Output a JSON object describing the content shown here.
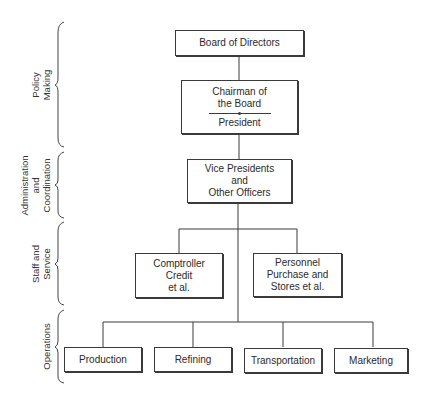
{
  "levels": [
    {
      "label_lines": [
        "Policy",
        "Making"
      ]
    },
    {
      "label_lines": [
        "Administration",
        "and",
        "Coordination"
      ]
    },
    {
      "label_lines": [
        "Staff and",
        "Service"
      ]
    },
    {
      "label_lines": [
        "Operations"
      ]
    }
  ],
  "nodes": {
    "board": {
      "lines": [
        "Board of Directors"
      ]
    },
    "chairman": {
      "lines": [
        "Chairman of",
        "the Board"
      ],
      "below_separator": "President"
    },
    "vp": {
      "lines": [
        "Vice Presidents",
        "and",
        "Other Officers"
      ]
    },
    "comptroller": {
      "lines": [
        "Comptroller",
        "Credit",
        "et al."
      ]
    },
    "personnel": {
      "lines": [
        "Personnel",
        "Purchase and",
        "Stores et al."
      ]
    },
    "production": {
      "lines": [
        "Production"
      ]
    },
    "refining": {
      "lines": [
        "Refining"
      ]
    },
    "transportation": {
      "lines": [
        "Transportation"
      ]
    },
    "marketing": {
      "lines": [
        "Marketing"
      ]
    }
  }
}
